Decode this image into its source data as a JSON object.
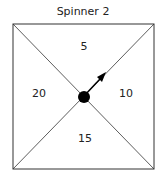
{
  "title": "Spinner 2",
  "sections": [
    {
      "position": "top",
      "value": "5"
    },
    {
      "position": "right",
      "value": "10"
    },
    {
      "position": "bottom",
      "value": "15"
    },
    {
      "position": "left",
      "value": "20"
    }
  ],
  "pointer": {
    "direction": "upper-right"
  }
}
